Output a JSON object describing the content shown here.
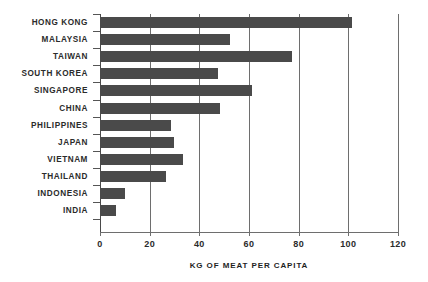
{
  "chart_data": {
    "type": "bar",
    "orientation": "horizontal",
    "title": "",
    "xlabel": "KG OF MEAT PER CAPITA",
    "ylabel": "",
    "categories": [
      "HONG KONG",
      "MALAYSIA",
      "TAIWAN",
      "SOUTH KOREA",
      "SINGAPORE",
      "CHINA",
      "PHILIPPINES",
      "JAPAN",
      "VIETNAM",
      "THAILAND",
      "INDONESIA",
      "INDIA"
    ],
    "values": [
      101,
      52,
      77,
      47,
      61,
      48,
      28,
      29.5,
      33,
      26,
      9.5,
      6
    ],
    "xlim": [
      0,
      120
    ],
    "xticks": [
      0,
      20,
      40,
      60,
      80,
      100,
      120
    ],
    "xtick_labels": [
      "0",
      "20",
      "40",
      "60",
      "80",
      "100",
      "120"
    ],
    "grid": "vertical",
    "legend": "none",
    "bar_color": "#4a4a4a",
    "axis_color": "#6e6e6e",
    "text_color": "#2b2b2b"
  }
}
